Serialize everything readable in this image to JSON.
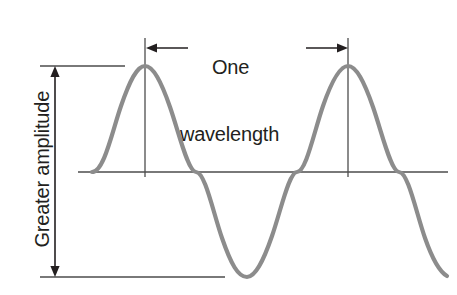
{
  "figure": {
    "background_color": "#ffffff",
    "wave_color": "#8c8c8c",
    "annotation_color": "#231f20",
    "labels": {
      "wavelength_line1": "One",
      "wavelength_line2": "wavelength",
      "amplitude": "Greater amplitude"
    },
    "icons": {
      "left_arrow": "arrow-left-icon",
      "right_arrow": "arrow-right-icon",
      "up_arrow": "arrow-up-icon",
      "down_arrow": "arrow-down-icon"
    }
  },
  "chart_data": {
    "type": "line",
    "xlabel": "",
    "ylabel": "Greater amplitude",
    "grid": false,
    "legend": null,
    "annotations": [
      {
        "name": "wavelength-measure",
        "text": "One wavelength",
        "kind": "double-arrow-horizontal",
        "from_x": 145,
        "to_x": 348,
        "y": 48,
        "span_px": 203
      },
      {
        "name": "amplitude-measure",
        "text": "Greater amplitude",
        "kind": "double-arrow-vertical",
        "x": 55,
        "from_y": 66,
        "to_y": 277,
        "span_px": 211
      }
    ],
    "axis": {
      "baseline_y": 172,
      "baseline_x_start": 78,
      "baseline_x_end": 448
    },
    "reference_lines": [
      {
        "name": "crest-tick",
        "orientation": "horizontal",
        "y": 66,
        "x_start": 40,
        "x_end": 125
      },
      {
        "name": "trough-tick",
        "orientation": "horizontal",
        "y": 277,
        "x_start": 40,
        "x_end": 225
      },
      {
        "name": "first-crest-marker",
        "orientation": "vertical",
        "x": 145,
        "y_start": 38,
        "y_end": 177
      },
      {
        "name": "second-crest-marker",
        "orientation": "vertical",
        "x": 348,
        "y_start": 38,
        "y_end": 177
      }
    ],
    "wave": {
      "form": "sine",
      "amplitude_px": 106,
      "wavelength_px": 203,
      "baseline_y": 172,
      "crest_y": 66,
      "trough_y": 277,
      "crest_x": [
        145,
        348
      ],
      "trough_x": [
        247,
        450
      ],
      "zero_crossings_x": [
        94,
        196,
        297,
        399
      ],
      "x_start": 92,
      "x_end": 447,
      "cycles_shown": 1.75,
      "path": "M 92,172 C 104,172 112,132 121,106 C 130,80 137,66 145,66 C 153,66 161,81 170,107 C 179,133 188,172 196,172 C 205,172 213,212 222,238 C 231,264 238,277 247,277 C 255,277 263,262 272,236 C 281,210 289,172 297,172 C 306,172 314,132 323,106 C 332,80 340,66 348,66 C 356,66 364,81 373,107 C 382,133 391,172 399,172 C 408,172 416,212 425,238 C 432,258 440,272 447,276"
    }
  }
}
